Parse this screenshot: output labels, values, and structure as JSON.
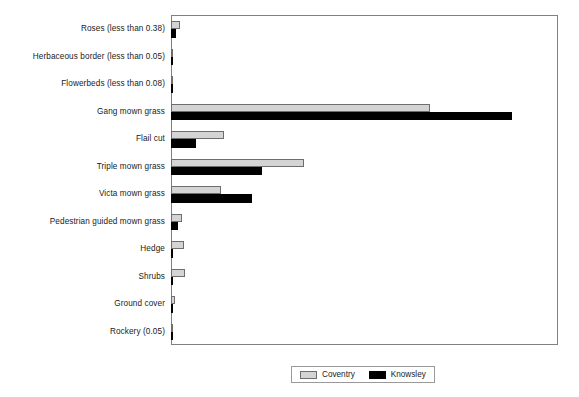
{
  "chart_data": {
    "type": "bar",
    "orientation": "horizontal",
    "title": "",
    "subtitle": "",
    "xlabel": "",
    "ylabel": "",
    "grid": false,
    "xlim": [
      0,
      16
    ],
    "legend_position": "bottom-center",
    "categories": [
      "Roses (less than 0.38)",
      "Herbaceous border (less than 0.05)",
      "Flowerbeds (less than 0.08)",
      "Gang mown grass",
      "Flail cut",
      "Triple mown grass",
      "Victa mown grass",
      "Pedestrian guided mown grass",
      "Hedge",
      "Shrubs",
      "Ground cover",
      "Rockery (0.05)"
    ],
    "series": [
      {
        "name": "Coventry",
        "color": "#d4d4d4",
        "values": [
          0.38,
          0.05,
          0.08,
          10.7,
          2.2,
          5.5,
          2.05,
          0.45,
          0.55,
          0.58,
          0.15,
          0.0
        ]
      },
      {
        "name": "Knowsley",
        "color": "#000000",
        "values": [
          0.2,
          0.0,
          0.0,
          14.1,
          1.05,
          3.75,
          3.35,
          0.3,
          0.05,
          0.1,
          0.0,
          0.05
        ]
      }
    ]
  },
  "legend": {
    "items": [
      {
        "label": "Coventry",
        "swatch": "coventry-swatch"
      },
      {
        "label": "Knowsley",
        "swatch": "knowsley-swatch"
      }
    ]
  }
}
